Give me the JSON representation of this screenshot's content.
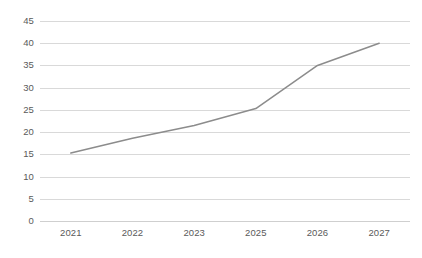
{
  "chart_data": {
    "type": "line",
    "title": "",
    "subtitle": "",
    "xlabel": "",
    "ylabel": "",
    "categories": [
      "2021",
      "2022",
      "2023",
      "2025",
      "2026",
      "2027"
    ],
    "series": [
      {
        "name": "Series 1",
        "values": [
          15.3,
          18.6,
          21.5,
          25.3,
          35.0,
          40.0
        ],
        "color": "#8c8c8c"
      }
    ],
    "ylim": [
      0,
      45
    ],
    "ytick_step": 5,
    "yticks": [
      "45",
      "40",
      "35",
      "30",
      "25",
      "20",
      "15",
      "10",
      "5",
      "0"
    ],
    "grid": {
      "horizontal": true,
      "vertical": false,
      "color": "#d9d9d9"
    },
    "legend": {
      "visible": false,
      "position": "none",
      "entries": []
    },
    "annotations": [],
    "background_color": "#ffffff",
    "axis_label_color": "#5a5a5a"
  }
}
